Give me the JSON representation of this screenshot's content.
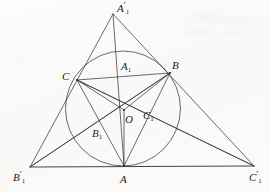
{
  "figure": {
    "background_color": "#fbfbfa",
    "stroke_color": "#3a3a3a",
    "label_color": "#1c1c1c",
    "width": 269,
    "height": 192
  },
  "points": [
    {
      "id": "A1prime",
      "label_base": "A",
      "label_sub": "1",
      "label_prime": "′",
      "x": 113,
      "y": 14,
      "label_x": 117,
      "label_y": 3,
      "role": "outer-triangle-apex"
    },
    {
      "id": "B1prime",
      "label_base": "B",
      "label_sub": "1",
      "label_prime": "′",
      "x": 30,
      "y": 167,
      "label_x": 13,
      "label_y": 172,
      "role": "outer-triangle-bottom-left"
    },
    {
      "id": "C1prime",
      "label_base": "C",
      "label_sub": "1",
      "label_prime": "′",
      "x": 254,
      "y": 166,
      "label_x": 249,
      "label_y": 172,
      "role": "outer-triangle-bottom-right"
    },
    {
      "id": "A",
      "label_base": "A",
      "label_sub": "",
      "label_prime": "",
      "x": 124,
      "y": 166,
      "label_x": 120,
      "label_y": 174,
      "role": "inner-triangle-vertex"
    },
    {
      "id": "B",
      "label_base": "B",
      "label_sub": "",
      "label_prime": "",
      "x": 170,
      "y": 73,
      "label_x": 172,
      "label_y": 60,
      "role": "inner-triangle-vertex"
    },
    {
      "id": "C",
      "label_base": "C",
      "label_sub": "",
      "label_prime": "",
      "x": 77,
      "y": 80,
      "label_x": 62,
      "label_y": 71,
      "role": "inner-triangle-vertex"
    },
    {
      "id": "O",
      "label_base": "O",
      "label_sub": "",
      "label_prime": "",
      "x": 124,
      "y": 110,
      "label_x": 125,
      "label_y": 114,
      "role": "circle-center"
    },
    {
      "id": "A1",
      "label_base": "A",
      "label_sub": "1",
      "label_prime": "",
      "x": 131,
      "y": 76,
      "label_x": 121,
      "label_y": 61,
      "role": "intersection-point"
    },
    {
      "id": "B1",
      "label_base": "B",
      "label_sub": "1",
      "label_prime": "",
      "x": 102,
      "y": 142,
      "label_x": 92,
      "label_y": 128,
      "role": "intersection-point"
    },
    {
      "id": "C1",
      "label_base": "C",
      "label_sub": "1",
      "label_prime": "",
      "x": 146,
      "y": 122,
      "label_x": 143,
      "label_y": 110,
      "role": "intersection-point"
    }
  ],
  "circle": {
    "id": "incircle",
    "cx": 123,
    "cy": 108.5,
    "r": 57.5,
    "stroke": "#3a3a3a"
  },
  "segments": [
    {
      "id": "outer-left-side",
      "from": "A1prime",
      "to": "B1prime"
    },
    {
      "id": "outer-right-side",
      "from": "A1prime",
      "to": "C1prime"
    },
    {
      "id": "outer-base",
      "from": "B1prime",
      "to": "C1prime"
    },
    {
      "id": "inner-side-CB",
      "from": "C",
      "to": "B"
    },
    {
      "id": "inner-side-CA",
      "from": "C",
      "to": "A"
    },
    {
      "id": "inner-side-BA",
      "from": "B",
      "to": "A"
    },
    {
      "id": "cevian-apex-to-A",
      "from": "A1prime",
      "to": "A"
    },
    {
      "id": "cevian-Bprime-to-B",
      "from": "B1prime",
      "to": "B"
    },
    {
      "id": "cevian-Cprime-to-C",
      "from": "C1prime",
      "to": "C"
    },
    {
      "id": "chord-C-to-B",
      "from": "C",
      "to": "B"
    },
    {
      "id": "ray-C-to-Cprime",
      "from": "C",
      "to": "C1prime"
    },
    {
      "id": "ray-B-to-Bprime",
      "from": "B",
      "to": "B1prime"
    },
    {
      "id": "radius-O-to-A",
      "from": "O",
      "to": "A"
    },
    {
      "id": "radius-O-to-B",
      "from": "O",
      "to": "B"
    },
    {
      "id": "radius-O-to-C",
      "from": "O",
      "to": "C"
    }
  ],
  "caption": ""
}
